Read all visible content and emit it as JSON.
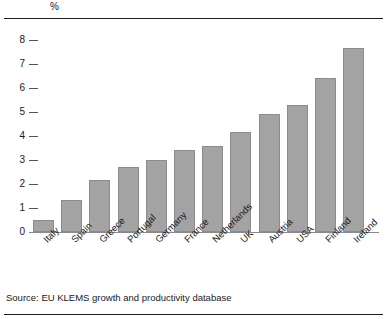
{
  "figure": {
    "unit_label": "%",
    "source_note": "Source: EU KLEMS growth and productivity database"
  },
  "chart_data": {
    "type": "bar",
    "title": "",
    "subtitle": "",
    "xlabel": "",
    "ylabel": "%",
    "ylim": [
      0,
      8
    ],
    "yticks": [
      0,
      1,
      2,
      3,
      4,
      5,
      6,
      7,
      8
    ],
    "ytick_labels": [
      "0",
      "1",
      "2",
      "3",
      "4",
      "5",
      "6",
      "7",
      "8"
    ],
    "grid": false,
    "legend": "none",
    "bar_color": "#a3a3a3",
    "bar_edge_color": "#8c8c8c",
    "categories": [
      "Italy",
      "Spain",
      "Greece",
      "Portugal",
      "Germany",
      "France",
      "Netherlands",
      "UK",
      "Austria",
      "USA",
      "Finland",
      "Ireland"
    ],
    "values": [
      0.5,
      1.35,
      2.15,
      2.7,
      3.0,
      3.4,
      3.6,
      4.15,
      4.9,
      5.3,
      6.4,
      7.65
    ],
    "source": "EU KLEMS growth and productivity database"
  }
}
